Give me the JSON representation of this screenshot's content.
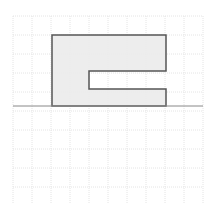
{
  "diagram": {
    "type": "grid-shape",
    "grid": {
      "x0": 13,
      "y0": 16,
      "cell": 19,
      "cols": 10,
      "rows": 10,
      "color": "#e4e4e4"
    },
    "baseline": {
      "y": 106,
      "x1": 13,
      "x2": 203,
      "color": "#888888"
    },
    "shape": {
      "fill": "#ebebeb",
      "stroke": "#555555",
      "points": [
        [
          52,
          106
        ],
        [
          52,
          35
        ],
        [
          166,
          35
        ],
        [
          166,
          71
        ],
        [
          89,
          71
        ],
        [
          89,
          89
        ],
        [
          166,
          89
        ],
        [
          166,
          106
        ]
      ]
    }
  }
}
